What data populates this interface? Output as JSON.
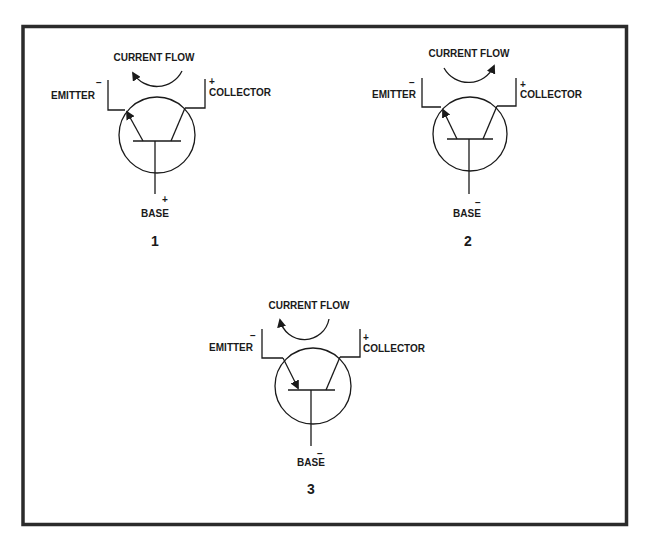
{
  "figure": {
    "frame_color": "#2b2b2b",
    "line_color": "#1a1a1a",
    "diagrams": [
      {
        "id": "1",
        "number": "1",
        "current_flow_label": "CURRENT FLOW",
        "current_flow_direction": "counterclockwise (arrow at upper-left)",
        "emitter_label": "EMITTER",
        "emitter_polarity": "−",
        "collector_label": "COLLECTOR",
        "collector_polarity": "+",
        "base_label": "BASE",
        "base_polarity": "+",
        "emitter_arrow": "pointing outward toward emitter lead"
      },
      {
        "id": "2",
        "number": "2",
        "current_flow_label": "CURRENT FLOW",
        "current_flow_direction": "clockwise (arrow at upper-right)",
        "emitter_label": "EMITTER",
        "emitter_polarity": "−",
        "collector_label": "COLLECTOR",
        "collector_polarity": "+",
        "base_label": "BASE",
        "base_polarity": "−",
        "emitter_arrow": "pointing outward toward emitter lead"
      },
      {
        "id": "3",
        "number": "3",
        "current_flow_label": "CURRENT FLOW",
        "current_flow_direction": "counterclockwise (arrow at upper-left)",
        "emitter_label": "EMITTER",
        "emitter_polarity": "−",
        "collector_label": "COLLECTOR",
        "collector_polarity": "+",
        "base_label": "BASE",
        "base_polarity": "−",
        "emitter_arrow": "pointing inward toward base"
      }
    ],
    "caption": ""
  }
}
